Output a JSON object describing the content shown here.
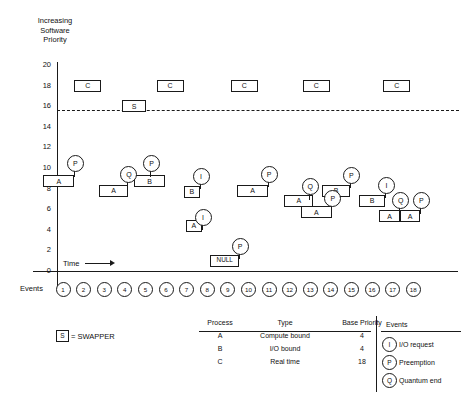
{
  "figure": {
    "y_axis_title_lines": [
      "Increasing",
      "Software",
      "Priority"
    ],
    "time_label": "Time",
    "events_label": "Events",
    "swapper_legend": {
      "box": "S",
      "text": "= SWAPPER"
    }
  },
  "chart_data": {
    "type": "timeline",
    "xlabel": "Time",
    "ylabel": "Increasing Software Priority",
    "ylim": [
      0,
      20
    ],
    "yticks": [
      0,
      2,
      4,
      6,
      8,
      10,
      12,
      14,
      16,
      18,
      20
    ],
    "grid": false,
    "event_numbers": [
      1,
      2,
      3,
      4,
      5,
      6,
      7,
      8,
      9,
      10,
      11,
      12,
      13,
      14,
      15,
      16,
      17,
      18
    ],
    "swapper_threshold": 15.6,
    "threshold_style": "dashed",
    "boxes": [
      {
        "label": "C",
        "priority": 18,
        "start_event": 1.6,
        "end_event": 2.9
      },
      {
        "label": "C",
        "priority": 18,
        "start_event": 5.6,
        "end_event": 6.9
      },
      {
        "label": "C",
        "priority": 18,
        "start_event": 9.2,
        "end_event": 10.5
      },
      {
        "label": "C",
        "priority": 18,
        "start_event": 12.7,
        "end_event": 14.0
      },
      {
        "label": "C",
        "priority": 18,
        "start_event": 16.6,
        "end_event": 17.9
      },
      {
        "label": "S",
        "priority": 16,
        "start_event": 3.9,
        "end_event": 5.1
      },
      {
        "label": "A",
        "priority": 8.7,
        "start_event": 0.1,
        "end_event": 1.6
      },
      {
        "label": "A",
        "priority": 7.8,
        "start_event": 2.8,
        "end_event": 4.2
      },
      {
        "label": "B",
        "priority": 8.7,
        "start_event": 4.5,
        "end_event": 6.0
      },
      {
        "label": "B",
        "priority": 7.7,
        "start_event": 6.9,
        "end_event": 7.7
      },
      {
        "label": "A",
        "priority": 4.4,
        "start_event": 7.0,
        "end_event": 7.8
      },
      {
        "label": "NULL",
        "priority": 1.0,
        "start_event": 8.2,
        "end_event": 9.6
      },
      {
        "label": "A",
        "priority": 7.8,
        "start_event": 9.5,
        "end_event": 11.0
      },
      {
        "label": "A",
        "priority": 6.8,
        "start_event": 11.8,
        "end_event": 13.2
      },
      {
        "label": "A",
        "priority": 5.7,
        "start_event": 12.6,
        "end_event": 14.1
      },
      {
        "label": "B",
        "priority": 7.8,
        "start_event": 13.6,
        "end_event": 15.0
      },
      {
        "label": "B",
        "priority": 6.8,
        "start_event": 15.4,
        "end_event": 16.7
      },
      {
        "label": "A",
        "priority": 5.3,
        "start_event": 16.4,
        "end_event": 17.4
      },
      {
        "label": "A",
        "priority": 5.3,
        "start_event": 17.4,
        "end_event": 18.4
      }
    ],
    "markers": [
      {
        "label": "P",
        "event": 1.6,
        "priority": 10.5
      },
      {
        "label": "Q",
        "event": 4.2,
        "priority": 9.5
      },
      {
        "label": "P",
        "event": 5.3,
        "priority": 10.5
      },
      {
        "label": "I",
        "event": 7.7,
        "priority": 9.3
      },
      {
        "label": "I",
        "event": 7.8,
        "priority": 5.3
      },
      {
        "label": "P",
        "event": 9.6,
        "priority": 2.5
      },
      {
        "label": "P",
        "event": 11.0,
        "priority": 9.5
      },
      {
        "label": "Q",
        "event": 13.0,
        "priority": 8.3
      },
      {
        "label": "P",
        "event": 14.1,
        "priority": 7.1
      },
      {
        "label": "P",
        "event": 15.0,
        "priority": 9.4
      },
      {
        "label": "I",
        "event": 16.7,
        "priority": 8.4
      },
      {
        "label": "Q",
        "event": 17.4,
        "priority": 6.9
      },
      {
        "label": "P",
        "event": 18.4,
        "priority": 6.9
      }
    ]
  },
  "process_table": {
    "headers": [
      "Process",
      "Type",
      "Base Priority"
    ],
    "rows": [
      [
        "A",
        "Compute bound",
        "4"
      ],
      [
        "B",
        "I/O bound",
        "4"
      ],
      [
        "C",
        "Real time",
        "18"
      ]
    ]
  },
  "events_legend": {
    "header": "Events",
    "items": [
      {
        "symbol": "I",
        "text": "I/O request"
      },
      {
        "symbol": "P",
        "text": "Preemption"
      },
      {
        "symbol": "Q",
        "text": "Quantum end"
      }
    ]
  }
}
